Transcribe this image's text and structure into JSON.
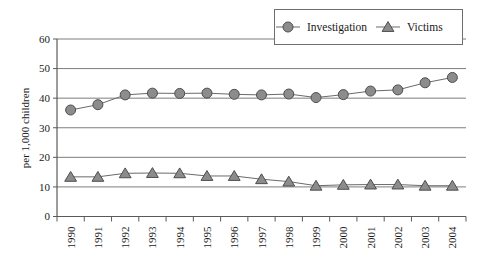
{
  "chart_data": {
    "type": "line",
    "title": "",
    "xlabel": "",
    "ylabel": "per 1,000 children",
    "categories": [
      "1990",
      "1991",
      "1992",
      "1993",
      "1994",
      "1995",
      "1996",
      "1997",
      "1998",
      "1999",
      "2000",
      "2001",
      "2002",
      "2003",
      "2004"
    ],
    "ylim": [
      0,
      60
    ],
    "yticks": [
      0,
      10,
      20,
      30,
      40,
      50,
      60
    ],
    "ytick_labels": [
      "0",
      "10",
      "20",
      "30",
      "40",
      "50",
      "60"
    ],
    "grid": true,
    "grid_axis": "y",
    "legend_position": "top-right",
    "series": [
      {
        "name": "Investigation",
        "marker": "circle",
        "color": "#8c8c8c",
        "edge_color": "#4d4d4d",
        "values": [
          36.0,
          37.8,
          41.1,
          41.7,
          41.6,
          41.7,
          41.3,
          41.1,
          41.4,
          40.2,
          41.2,
          42.4,
          42.8,
          45.2,
          47.0
        ]
      },
      {
        "name": "Victims",
        "marker": "triangle",
        "color": "#8c8c8c",
        "edge_color": "#4d4d4d",
        "values": [
          13.4,
          13.4,
          14.6,
          14.7,
          14.6,
          13.7,
          13.7,
          12.6,
          11.8,
          10.4,
          10.7,
          10.8,
          10.8,
          10.4,
          10.4
        ]
      }
    ]
  },
  "legend": {
    "items": [
      {
        "label": "Investigation",
        "marker": "circle"
      },
      {
        "label": "Victims",
        "marker": "triangle"
      }
    ]
  },
  "axes": {
    "y_title": "per 1,000 children"
  }
}
